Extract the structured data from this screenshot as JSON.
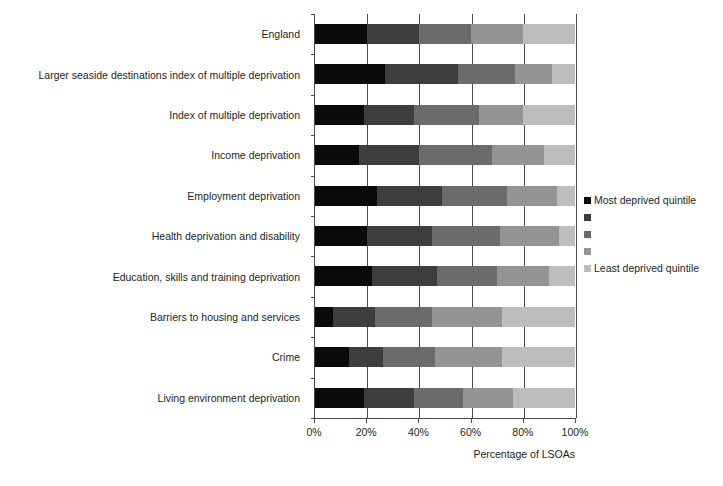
{
  "chart_data": {
    "type": "bar",
    "orientation": "horizontal",
    "stacked": true,
    "stack_mode": "percent",
    "title": "",
    "subtitle": "",
    "xlabel": "Percentage of LSOAs",
    "ylabel": "",
    "xlim": [
      0,
      100
    ],
    "xtick_labels": [
      "0%",
      "20%",
      "40%",
      "60%",
      "80%",
      "100%"
    ],
    "xtick_values": [
      0,
      20,
      40,
      60,
      80,
      100
    ],
    "grid": "vertical",
    "legend_position": "right",
    "categories": [
      "England",
      "Larger seaside destinations index of multiple deprivation",
      "Index of multiple deprivation",
      "Income deprivation",
      "Employment deprivation",
      "Health deprivation and disability",
      "Education, skills and training deprivation",
      "Barriers to housing and services",
      "Crime",
      "Living environment deprivation"
    ],
    "series": [
      {
        "name": "Most deprived quintile",
        "color": "#0a0a0a",
        "values": [
          20,
          27,
          19,
          17,
          24,
          20,
          22,
          7,
          13,
          19
        ]
      },
      {
        "name": "Second most deprived quintile",
        "color": "#3d3d3d",
        "values": [
          20,
          28,
          19,
          23,
          25,
          25,
          25,
          16,
          13,
          19
        ]
      },
      {
        "name": "Middle quintile",
        "color": "#6b6b6b",
        "values": [
          20,
          22,
          25,
          28,
          25,
          26,
          23,
          22,
          20,
          19
        ]
      },
      {
        "name": "Second least deprived quintile",
        "color": "#949494",
        "values": [
          20,
          14,
          17,
          20,
          19,
          23,
          20,
          27,
          26,
          19
        ]
      },
      {
        "name": "Least deprived quintile",
        "color": "#bdbdbd",
        "values": [
          20,
          9,
          20,
          12,
          7,
          6,
          10,
          28,
          28,
          24
        ]
      }
    ],
    "cumulative_boundaries": {
      "England": [
        20,
        40,
        60,
        80,
        100
      ],
      "Larger seaside destinations index of multiple deprivation": [
        27,
        55,
        77,
        91,
        100
      ],
      "Index of multiple deprivation": [
        19,
        38,
        63,
        80,
        100
      ],
      "Income deprivation": [
        17,
        40,
        68,
        88,
        100
      ],
      "Employment deprivation": [
        24,
        49,
        74,
        93,
        100
      ],
      "Health deprivation and disability": [
        20,
        45,
        71,
        94,
        100
      ],
      "Education, skills and training deprivation": [
        22,
        47,
        70,
        90,
        100
      ],
      "Barriers to housing and services": [
        7,
        23,
        45,
        72,
        100
      ],
      "Crime": [
        13,
        26,
        46,
        72,
        100
      ],
      "Living environment deprivation": [
        19,
        38,
        57,
        76,
        100
      ]
    },
    "legend": {
      "entries": [
        {
          "label": "Most deprived quintile",
          "color": "#0a0a0a"
        },
        {
          "label": "",
          "color": "#3d3d3d"
        },
        {
          "label": "",
          "color": "#6b6b6b"
        },
        {
          "label": "",
          "color": "#949494"
        },
        {
          "label": "Least deprived quintile",
          "color": "#bdbdbd"
        }
      ]
    }
  },
  "axis": {
    "x_title": "Percentage of LSOAs"
  },
  "legend": {
    "first_label": "Most deprived quintile",
    "last_label": "Least deprived quintile"
  }
}
